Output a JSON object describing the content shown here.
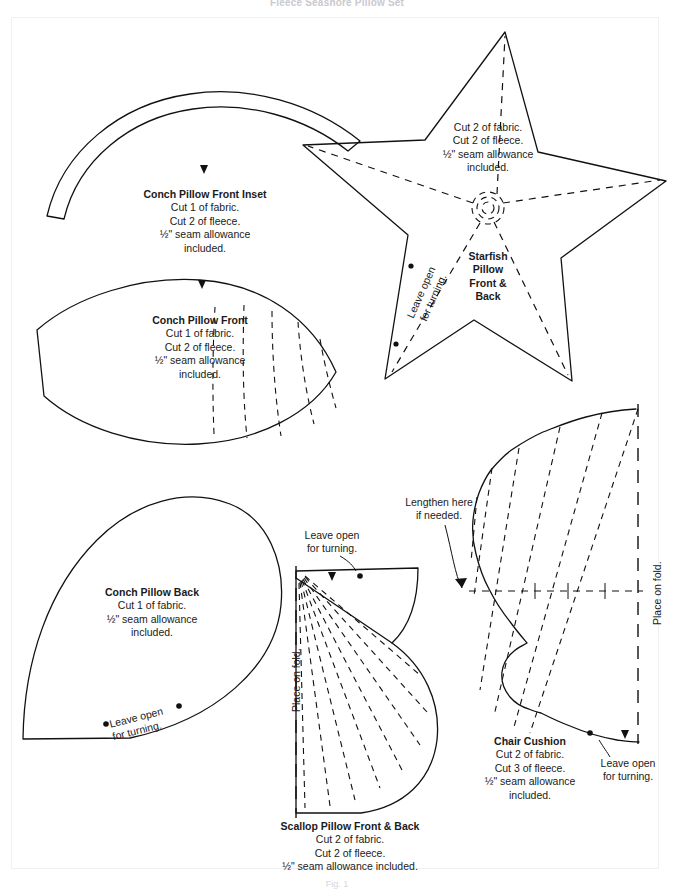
{
  "page": {
    "header_title": "Fleece Seashore Pillow Set",
    "figure_caption": "Fig. 1"
  },
  "pieces": [
    {
      "id": "conch-front-inset",
      "title": "Conch Pillow Front Inset",
      "lines": [
        "Cut 1 of fabric.",
        "Cut 2 of fleece.",
        "½\" seam allowance",
        "included."
      ]
    },
    {
      "id": "conch-front",
      "title": "Conch Pillow Front",
      "lines": [
        "Cut 1 of fabric.",
        "Cut 2 of fleece.",
        "½\" seam allowance",
        "included."
      ]
    },
    {
      "id": "starfish",
      "title_lines": [
        "Starfish",
        "Pillow",
        "Front &",
        "Back"
      ],
      "lines": [
        "Cut 2 of fabric.",
        "Cut 2 of fleece.",
        "½\" seam allowance",
        "included."
      ]
    },
    {
      "id": "conch-back",
      "title": "Conch Pillow Back",
      "lines": [
        "Cut 1 of fabric.",
        "½\" seam allowance",
        "included."
      ]
    },
    {
      "id": "scallop",
      "title": "Scallop Pillow Front & Back",
      "lines": [
        "Cut 2 of fabric.",
        "Cut 2 of fleece.",
        "½\" seam allowance included."
      ]
    },
    {
      "id": "chair-cushion",
      "title": "Chair Cushion",
      "lines": [
        "Cut 2 of fabric.",
        "Cut 3 of fleece.",
        "½\" seam allowance",
        "included."
      ]
    }
  ],
  "annotations": {
    "leave_open_starfish": [
      "Leave open",
      "for turning."
    ],
    "leave_open_conch_back": [
      "Leave open",
      "for turning."
    ],
    "leave_open_scallop": [
      "Leave open",
      "for turning."
    ],
    "leave_open_chair": [
      "Leave open",
      "for turning."
    ],
    "lengthen": [
      "Lengthen here",
      "if needed."
    ],
    "place_on_fold_scallop": "Place on fold.",
    "place_on_fold_chair": "Place on fold."
  },
  "colors": {
    "ink": "#111111",
    "paper": "#ffffff",
    "faint": "#c9c9cf"
  }
}
